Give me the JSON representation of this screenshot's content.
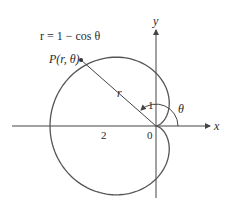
{
  "diagram": {
    "type": "polar-cardioid",
    "equation_label": "r = 1 − cos θ",
    "point_label": "P(r, θ)",
    "radius_label": "r",
    "angle_label": "θ",
    "axes": {
      "x_label": "x",
      "y_label": "y",
      "origin_label": "0"
    },
    "tick_labels": {
      "y_one": "1",
      "x_two": "2"
    },
    "colors": {
      "curve": "#555555",
      "axes": "#444444",
      "text": "#2a2a2a"
    }
  }
}
